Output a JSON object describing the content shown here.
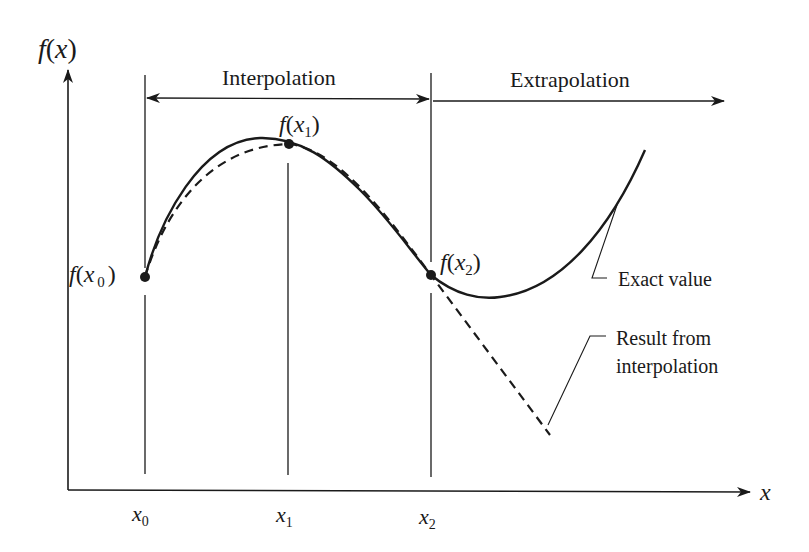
{
  "diagram": {
    "type": "interpolation-vs-extrapolation",
    "axes": {
      "y_label_fn": "f",
      "y_label_arg": "x",
      "x_label": "x"
    },
    "regions": {
      "interpolation": "Interpolation",
      "extrapolation": "Extrapolation"
    },
    "points": [
      {
        "fn": "f",
        "var": "x",
        "sub": "1",
        "tick_label": "x",
        "tick_sub": "1"
      },
      {
        "fn": "f",
        "var": "x",
        "sub": "0",
        "tick_label": "x",
        "tick_sub": "0"
      },
      {
        "fn": "f",
        "var": "x",
        "sub": "2",
        "tick_label": "x",
        "tick_sub": "2"
      }
    ],
    "annotations": {
      "exact": "Exact value",
      "result_line1": "Result from",
      "result_line2": "interpolation"
    },
    "colors": {
      "ink": "#1a1a1a",
      "background": "#ffffff"
    }
  }
}
